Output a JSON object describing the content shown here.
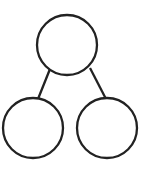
{
  "diagram": {
    "type": "tree",
    "stroke_color": "#222222",
    "background": "#ffffff",
    "nodes": [
      {
        "id": "top",
        "cx": 67,
        "cy": 45,
        "r": 30,
        "label": ""
      },
      {
        "id": "left",
        "cx": 33,
        "cy": 128,
        "r": 30,
        "label": ""
      },
      {
        "id": "right",
        "cx": 107,
        "cy": 128,
        "r": 30,
        "label": ""
      }
    ],
    "edges": [
      {
        "from": "top",
        "to": "left",
        "x1": 50,
        "y1": 69,
        "x2": 38,
        "y2": 99
      },
      {
        "from": "top",
        "to": "right",
        "x1": 90,
        "y1": 68,
        "x2": 106,
        "y2": 99
      }
    ]
  }
}
